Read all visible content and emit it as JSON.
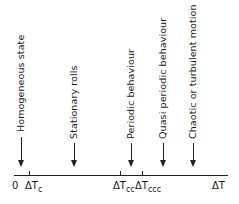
{
  "diagram": {
    "axis": {
      "origin_label": "0",
      "end_label": "ΔT",
      "ticks": [
        {
          "base": "ΔT",
          "sub": "c"
        },
        {
          "base": "ΔT",
          "sub": "cc"
        },
        {
          "base": "ΔT",
          "sub": "ccc"
        }
      ]
    },
    "regimes": [
      {
        "label": "Homogeneous state"
      },
      {
        "label": "Stationary rolls"
      },
      {
        "label": "Periodic behaviour"
      },
      {
        "label": "Quasi periodic behaviour"
      },
      {
        "label": "Chaotic or turbulent motion"
      }
    ]
  }
}
